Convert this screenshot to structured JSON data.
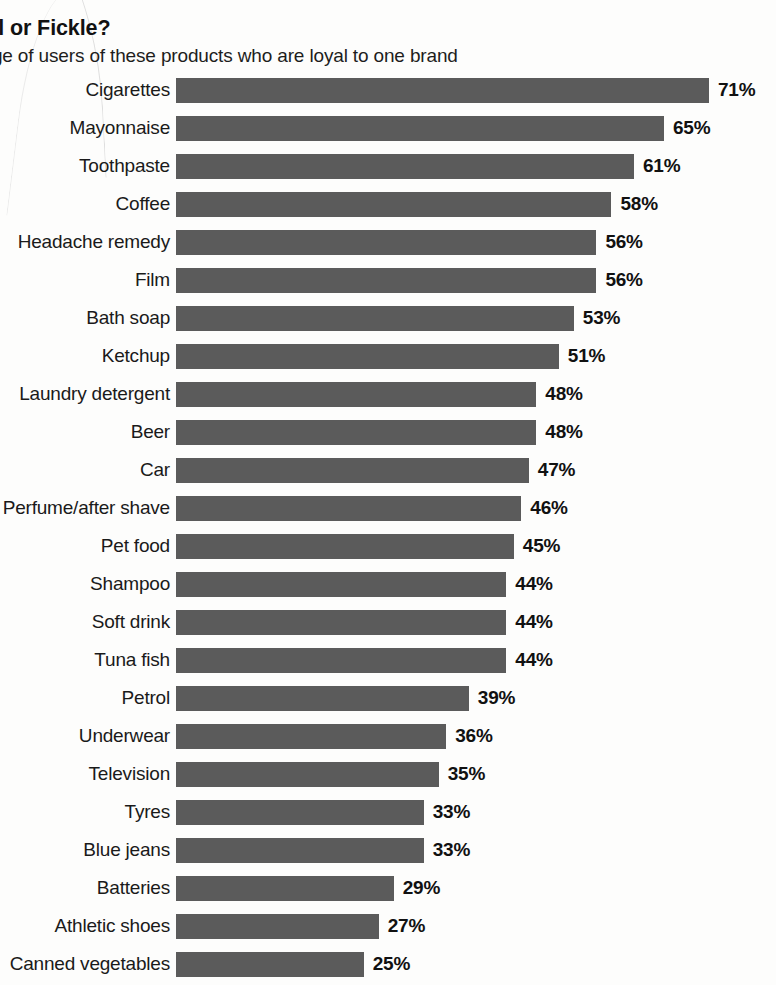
{
  "header": {
    "title": "thful or Fickle?",
    "subtitle": "rcentage of users of these products who are loyal to one brand"
  },
  "style": {
    "bar_color": "#5b5b5b",
    "text_color": "#1a1a1a",
    "background": "#fdfdfc"
  },
  "chart_data": {
    "type": "bar",
    "orientation": "horizontal",
    "title": "thful or Fickle?",
    "subtitle": "rcentage of users of these products who are loyal to one brand",
    "xlabel": "",
    "ylabel": "",
    "xlim": [
      0,
      75
    ],
    "grid": false,
    "legend": null,
    "value_suffix": "%",
    "categories": [
      "Cigarettes",
      "Mayonnaise",
      "Toothpaste",
      "Coffee",
      "Headache remedy",
      "Film",
      "Bath soap",
      "Ketchup",
      "Laundry detergent",
      "Beer",
      "Car",
      "Perfume/after shave",
      "Pet food",
      "Shampoo",
      "Soft drink",
      "Tuna fish",
      "Petrol",
      "Underwear",
      "Television",
      "Tyres",
      "Blue jeans",
      "Batteries",
      "Athletic shoes",
      "Canned vegetables",
      "Rubbish bags"
    ],
    "values": [
      71,
      65,
      61,
      58,
      56,
      56,
      53,
      51,
      48,
      48,
      47,
      46,
      45,
      44,
      44,
      44,
      39,
      36,
      35,
      33,
      33,
      29,
      27,
      25,
      23
    ],
    "value_labels": [
      "71%",
      "65%",
      "61%",
      "58%",
      "56%",
      "56%",
      "53%",
      "51%",
      "48%",
      "48%",
      "47%",
      "46%",
      "45%",
      "44%",
      "44%",
      "44%",
      "39%",
      "36%",
      "35%",
      "33%",
      "33%",
      "29%",
      "27%",
      "25%",
      "23%"
    ],
    "clipped_labels": {
      "Headache remedy": "Headache remedy",
      "Laundry detergent": "Laundry detergent",
      "Perfume/after shave": "erfume/after shave",
      "Canned vegetables": "Canned vegetables"
    }
  }
}
